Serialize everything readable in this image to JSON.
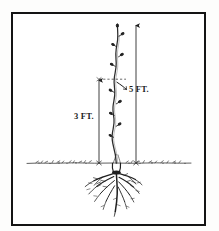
{
  "figure": {
    "kind": "line-drawing",
    "background_color": "#ffffff",
    "ink_color": "#1b1b1b",
    "frame": {
      "name": "figure-frame",
      "color": "#141414",
      "x": 11,
      "y": 12,
      "width": 195,
      "height": 214,
      "border_width": 2.5
    },
    "ground_line": {
      "label": "",
      "y": 163,
      "x_start": 26,
      "x_end": 192
    },
    "dimensions": [
      {
        "id": "three-feet",
        "label": "3 FT.",
        "value": 3,
        "unit": "FT.",
        "arrow_x": 99,
        "arrow_top_y": 79,
        "arrow_bottom_y": 163,
        "label_x": 74,
        "label_y": 111
      },
      {
        "id": "five-feet",
        "label": "5 FT.",
        "value": 5,
        "unit": "FT.",
        "arrow_x": 136,
        "arrow_top_y": 24,
        "arrow_bottom_y": 163,
        "label_x": 129,
        "label_y": 84
      }
    ],
    "trunk": {
      "name": "tree-trunk",
      "top_y": 24,
      "base_y": 163,
      "base_x": 117
    },
    "roots": {
      "name": "root-system",
      "top_y": 163,
      "bottom_y": 216,
      "left_x": 84,
      "right_x": 132
    }
  }
}
